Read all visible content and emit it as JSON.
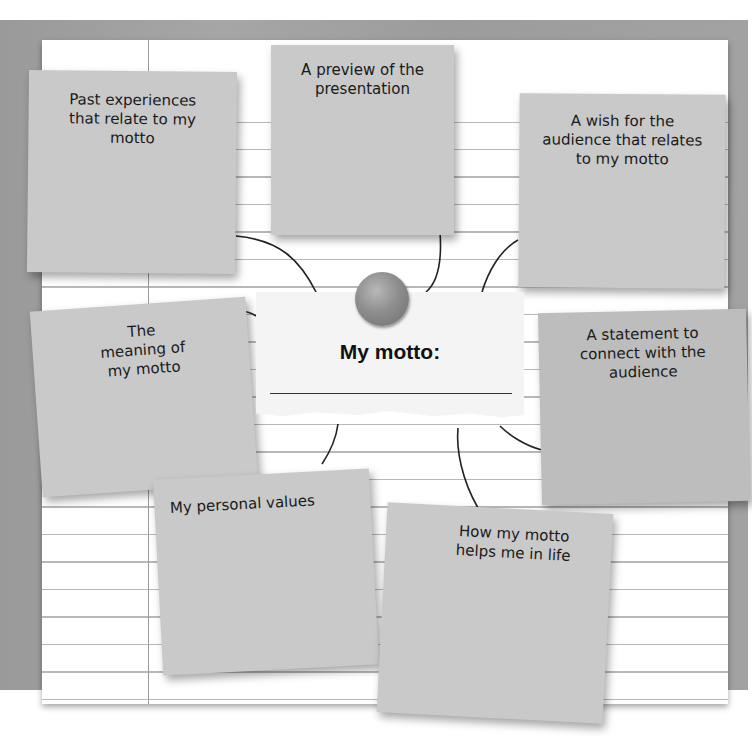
{
  "diagram": {
    "type": "mind-map / graphic organizer",
    "center": {
      "title": "My motto:",
      "answer_line": ""
    },
    "notes": [
      {
        "id": "past-experiences",
        "text": "Past experiences that relate to my motto"
      },
      {
        "id": "preview",
        "text": "A preview of the presentation"
      },
      {
        "id": "wish",
        "text": "A wish for the audience that relates to my motto"
      },
      {
        "id": "meaning",
        "text": "The meaning of my motto"
      },
      {
        "id": "statement",
        "text": "A statement to connect with the audience"
      },
      {
        "id": "personal-values",
        "text": "My personal values"
      },
      {
        "id": "helps-in-life",
        "text": "How my motto helps me in life"
      }
    ],
    "colors": {
      "board": "#a0a0a0",
      "paper": "#ffffff",
      "note": "#c9c9c9",
      "card": "#f4f4f4",
      "connector": "#222222"
    }
  }
}
